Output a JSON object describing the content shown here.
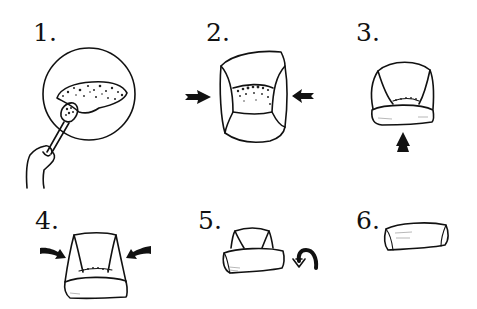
{
  "diagram": {
    "type": "step-by-step folding illustration",
    "steps": [
      {
        "number": "1.",
        "description": "Spoon filling onto a round wrapper held by hand"
      },
      {
        "number": "2.",
        "description": "Fold left and right sides inward (arrows pointing in)"
      },
      {
        "number": "3.",
        "description": "Fold bottom edge up over filling (arrow pointing up)"
      },
      {
        "number": "4.",
        "description": "Fold corners diagonally inward (angled arrows)"
      },
      {
        "number": "5.",
        "description": "Roll the wrap over (curved arrow)"
      },
      {
        "number": "6.",
        "description": "Finished rolled package"
      }
    ]
  },
  "colors": {
    "ink": "#111111",
    "background": "#ffffff"
  }
}
